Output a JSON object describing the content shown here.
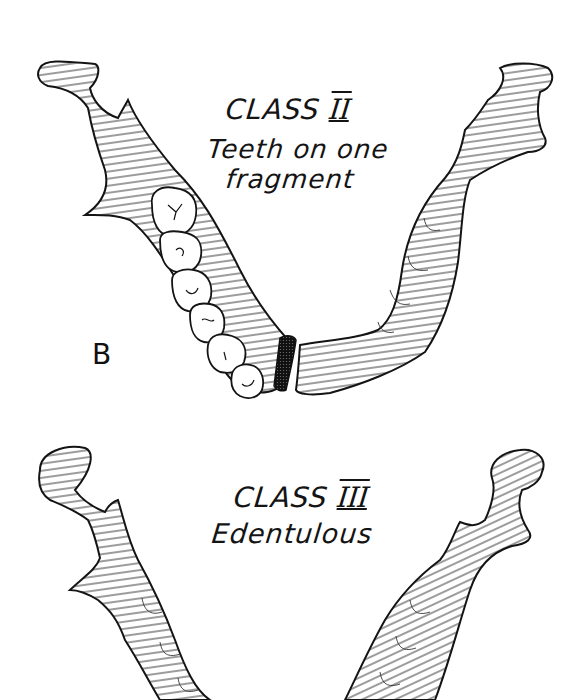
{
  "figure": {
    "panel_label": "B",
    "panels": [
      {
        "class_word": "CLASS",
        "class_numeral": "II",
        "description_line1": "Teeth on one",
        "description_line2": "fragment"
      },
      {
        "class_word": "CLASS",
        "class_numeral": "III",
        "description_line1": "Edentulous",
        "description_line2": ""
      }
    ]
  },
  "colors": {
    "ink": "#141414",
    "background": "#ffffff"
  }
}
